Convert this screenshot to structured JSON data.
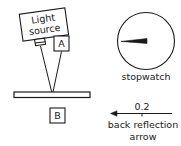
{
  "figure": {
    "title": "",
    "colors": {
      "ink": "#1a1a1a",
      "background": "#ffffff",
      "needle": "#1a1a1a"
    },
    "apparatus": {
      "light_source": {
        "label_line1": "Light",
        "label_line2": "source",
        "rotation_deg": -8
      },
      "detector_a": {
        "label": "A"
      },
      "sample_bar": {
        "label": ""
      },
      "detector_b": {
        "label": "B"
      }
    },
    "stopwatch": {
      "label": "stopwatch",
      "needle_direction": "left"
    },
    "back_reflection": {
      "value_label": "0.2",
      "caption_line1": "back reflection",
      "caption_line2": "arrow",
      "arrow_direction": "left"
    }
  }
}
